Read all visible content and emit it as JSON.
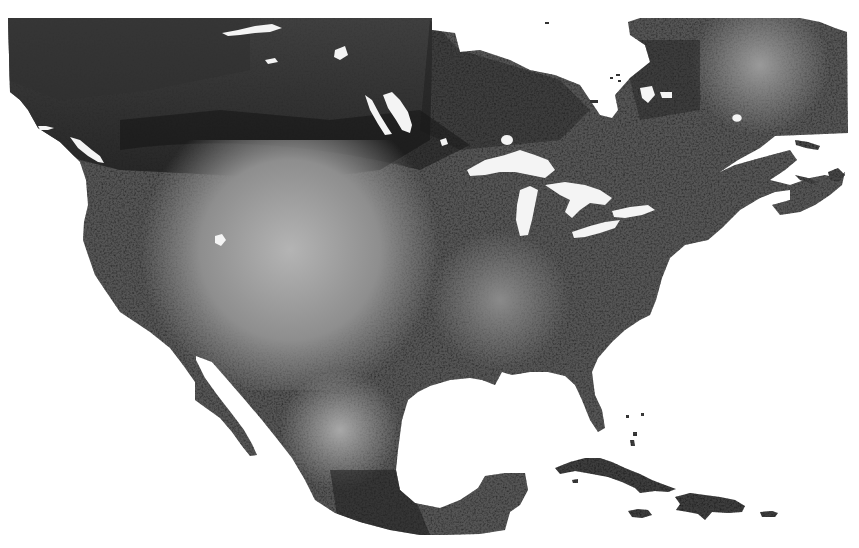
{
  "map": {
    "region": "North America",
    "style": "grayscale raster",
    "background_color": "#ffffff",
    "land_tones": {
      "darkest": "#1a1a1a",
      "dark": "#3a3a3a",
      "mid": "#6e6e6e",
      "light": "#a8a8a8",
      "lightest": "#c8c8c8"
    },
    "features": [
      {
        "name": "Canada"
      },
      {
        "name": "United States"
      },
      {
        "name": "Mexico"
      },
      {
        "name": "Hudson Bay"
      },
      {
        "name": "Great Lakes"
      },
      {
        "name": "Gulf of Mexico"
      },
      {
        "name": "Baja California"
      },
      {
        "name": "Cuba"
      },
      {
        "name": "Hispaniola"
      },
      {
        "name": "Jamaica"
      },
      {
        "name": "Puerto Rico"
      }
    ]
  }
}
